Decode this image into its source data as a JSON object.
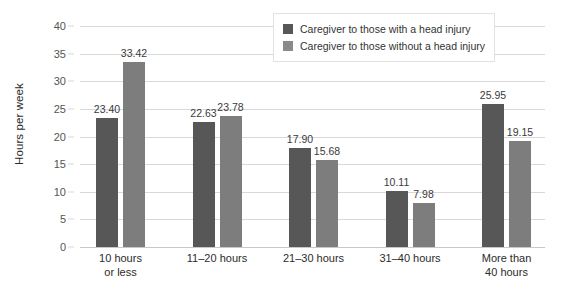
{
  "chart_data": {
    "type": "bar",
    "title": "",
    "subtitle": "",
    "xlabel": "",
    "ylabel": "Hours per week",
    "ylim": [
      0,
      40
    ],
    "ytick_step": 5,
    "yticks": [
      "0",
      "5",
      "10",
      "15",
      "20",
      "25",
      "30",
      "35",
      "40"
    ],
    "grid": true,
    "legend_position": "top-right",
    "categories": [
      "10 hours\nor less",
      "11–20 hours",
      "21–30 hours",
      "31–40 hours",
      "More than\n40 hours"
    ],
    "category_lines": [
      [
        "10 hours",
        "or less"
      ],
      [
        "11–20 hours",
        ""
      ],
      [
        "21–30 hours",
        ""
      ],
      [
        "31–40 hours",
        ""
      ],
      [
        "More than",
        "40 hours"
      ]
    ],
    "series": [
      {
        "name": "Caregiver to those with a head injury",
        "color": "#575757",
        "values": [
          23.4,
          22.63,
          17.9,
          10.11,
          25.95
        ],
        "labels": [
          "23.40",
          "22.63",
          "17.90",
          "10.11",
          "25.95"
        ]
      },
      {
        "name": "Caregiver to those without a head injury",
        "color": "#7d7d7d",
        "values": [
          33.42,
          23.78,
          15.68,
          7.98,
          19.15
        ],
        "labels": [
          "33.42",
          "23.78",
          "15.68",
          "7.98",
          "19.15"
        ]
      }
    ]
  },
  "legend": {
    "items": [
      {
        "label": "Caregiver to those with a head injury",
        "color": "#575757"
      },
      {
        "label": "Caregiver to those without a head injury",
        "color": "#8a8a8a"
      }
    ]
  },
  "colors": {
    "series_with_injury": "#575757",
    "series_without_injury": "#7d7d7d",
    "gridline": "#d8d8d8",
    "background": "#ffffff",
    "text": "#2b2b2b"
  }
}
